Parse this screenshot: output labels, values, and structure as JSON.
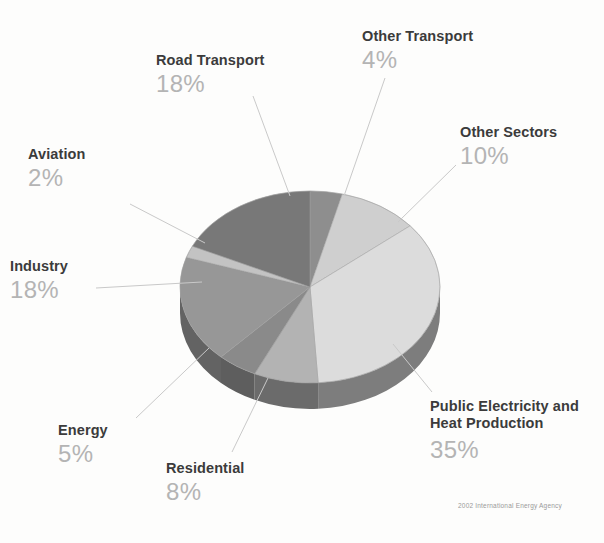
{
  "chart_data": {
    "type": "pie",
    "title": "",
    "subtitle": "",
    "credit": "2002 International Energy Agency",
    "legend_position": "callout-labels",
    "three_d": true,
    "total": 100,
    "unit": "%",
    "categories": [
      "Other Transport",
      "Other Sectors",
      "Public Electricity and Heat Production",
      "Residential",
      "Energy",
      "Industry",
      "Aviation",
      "Road Transport"
    ],
    "values": [
      4,
      10,
      35,
      8,
      5,
      18,
      2,
      18
    ],
    "slices": [
      {
        "label": "Other Transport",
        "value": 4,
        "pct_text": "4%",
        "color": "#8e8e8e",
        "side_color": "#6e6e6e"
      },
      {
        "label": "Other Sectors",
        "value": 10,
        "pct_text": "10%",
        "color": "#cfcfcf",
        "side_color": "#a8a8a8"
      },
      {
        "label": "Public Electricity and Heat Production",
        "value": 35,
        "pct_text": "35%",
        "color": "#dcdcdc",
        "side_color": "#7d7d7d"
      },
      {
        "label": "Residential",
        "value": 8,
        "pct_text": "8%",
        "color": "#b3b3b3",
        "side_color": "#6b6b6b"
      },
      {
        "label": "Energy",
        "value": 5,
        "pct_text": "5%",
        "color": "#8a8a8a",
        "side_color": "#5e5e5e"
      },
      {
        "label": "Industry",
        "value": 18,
        "pct_text": "18%",
        "color": "#979797",
        "side_color": "#636363"
      },
      {
        "label": "Aviation",
        "value": 2,
        "pct_text": "2%",
        "color": "#c3c3c3",
        "side_color": "#8a8a8a"
      },
      {
        "label": "Road Transport",
        "value": 18,
        "pct_text": "18%",
        "color": "#787878",
        "side_color": "#5a5a5a"
      }
    ]
  },
  "labels": {
    "road_transport": {
      "name": "Road Transport",
      "pct": "18%"
    },
    "other_transport": {
      "name": "Other Transport",
      "pct": "4%"
    },
    "other_sectors": {
      "name": "Other Sectors",
      "pct": "10%"
    },
    "aviation": {
      "name": "Aviation",
      "pct": "2%"
    },
    "industry": {
      "name": "Industry",
      "pct": "18%"
    },
    "energy": {
      "name": "Energy",
      "pct": "5%"
    },
    "residential": {
      "name": "Residential",
      "pct": "8%"
    },
    "public_electricity": {
      "name_line1": "Public Electricity and",
      "name_line2": "Heat Production",
      "pct": "35%"
    }
  },
  "credit": "2002 International Energy Agency",
  "colors": {
    "label_text": "#3b3b3b",
    "percent_text": "#b4b4b4",
    "leader_line": "#c9c9c9",
    "background": "#fdfdfc"
  }
}
